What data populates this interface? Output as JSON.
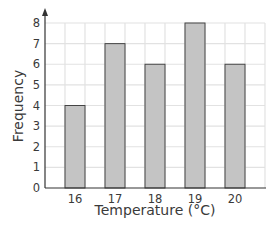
{
  "chart_data": {
    "type": "bar",
    "title": "",
    "xlabel": "Temperature (°C)",
    "ylabel": "Frequency",
    "categories": [
      "16",
      "17",
      "18",
      "19",
      "20"
    ],
    "values": [
      4,
      7,
      6,
      8,
      6
    ],
    "ylim": [
      0,
      8
    ],
    "yticks": [
      "0",
      "1",
      "2",
      "3",
      "4",
      "5",
      "6",
      "7",
      "8"
    ],
    "grid": true,
    "legend": null,
    "colors": {
      "bar_fill": "#c4c4c4",
      "bar_stroke": "#444444",
      "grid": "#e2e2e2",
      "axis": "#333333"
    }
  }
}
